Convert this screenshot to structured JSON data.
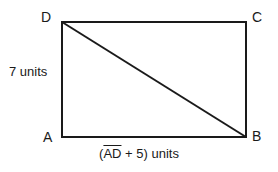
{
  "figure": {
    "type": "geometry-diagram",
    "shape": "rectangle-with-diagonal",
    "background_color": "#ffffff",
    "line_color": "#1a1a1a",
    "line_width_px": 2,
    "rectangle": {
      "left_px": 62,
      "top_px": 22,
      "right_px": 246,
      "bottom_px": 137
    },
    "diagonal": {
      "from": "D",
      "to": "B",
      "x1": 62,
      "y1": 22,
      "x2": 246,
      "y2": 137
    }
  },
  "vertices": {
    "top_left": "D",
    "top_right": "C",
    "bottom_left": "A",
    "bottom_right": "B"
  },
  "labels": {
    "left_side": "7 units",
    "bottom_side_prefix": "(",
    "bottom_side_segment": "AD",
    "bottom_side_suffix": " + 5) units",
    "bottom_side_full": "(AD + 5) units"
  },
  "measurements": {
    "height_value": 7,
    "height_units": "units",
    "width_expression": "AD + 5",
    "width_units": "units"
  }
}
